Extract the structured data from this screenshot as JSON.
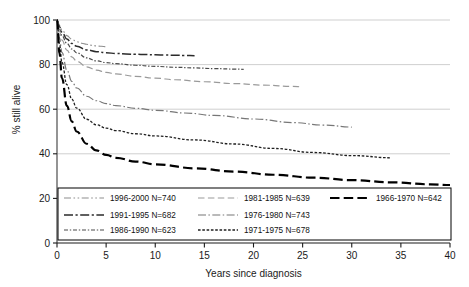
{
  "chart_data": {
    "type": "line",
    "title": "",
    "xlabel": "Years since diagnosis",
    "ylabel": "% still alive",
    "xlim": [
      0,
      40
    ],
    "ylim": [
      0,
      100
    ],
    "xticks": [
      0,
      5,
      10,
      15,
      20,
      25,
      30,
      35,
      40
    ],
    "yticks": [
      0,
      20,
      40,
      60,
      80,
      100
    ],
    "xtick_labels": [
      "0",
      "5",
      "10",
      "15",
      "20",
      "25",
      "30",
      "35",
      "40"
    ],
    "ytick_labels": [
      "0",
      "20",
      "40",
      "60",
      "80",
      "100"
    ],
    "grid": "horizontal",
    "legend_position": "bottom-inside",
    "series": [
      {
        "name": "1996-2000",
        "n": 740,
        "label": "1996-2000 N=740",
        "dash": "dash-dot-dot",
        "color": "#8d8d8d",
        "x": [
          0,
          0.25,
          0.5,
          1,
          1.5,
          2,
          2.5,
          3,
          3.5,
          4,
          4.5,
          5
        ],
        "y": [
          100,
          97.5,
          95.5,
          93.0,
          91.4,
          90.3,
          89.6,
          89.1,
          88.7,
          88.4,
          88.2,
          88.0
        ]
      },
      {
        "name": "1991-1995",
        "n": 682,
        "label": "1991-1995 N=682",
        "dash": "long-dash-dot",
        "color": "#2b2b2b",
        "x": [
          0,
          0.25,
          0.5,
          1,
          1.5,
          2,
          3,
          4,
          5,
          6,
          7,
          8,
          9,
          10,
          11,
          12,
          13,
          14
        ],
        "y": [
          100,
          97.0,
          94.5,
          91.5,
          89.5,
          88.2,
          86.6,
          85.8,
          85.3,
          85.0,
          84.8,
          84.6,
          84.5,
          84.4,
          84.3,
          84.2,
          84.1,
          84.0
        ]
      },
      {
        "name": "1986-1990",
        "n": 623,
        "label": "1986-1990 N=623",
        "dash": "fine-dash-dot",
        "color": "#4a4a4a",
        "x": [
          0,
          0.25,
          0.5,
          1,
          1.5,
          2,
          3,
          4,
          5,
          6,
          8,
          10,
          12,
          14,
          16,
          18,
          19
        ],
        "y": [
          100,
          96.0,
          93.0,
          89.5,
          87.0,
          85.3,
          83.0,
          81.7,
          80.9,
          80.4,
          79.7,
          79.2,
          78.8,
          78.5,
          78.2,
          78.0,
          77.9
        ]
      },
      {
        "name": "1981-1985",
        "n": 639,
        "label": "1981-1985 N=639",
        "dash": "dash",
        "color": "#9a9a9a",
        "x": [
          0,
          0.25,
          0.5,
          1,
          1.5,
          2,
          3,
          4,
          5,
          6,
          8,
          10,
          12,
          15,
          18,
          21,
          24,
          25
        ],
        "y": [
          100,
          95.0,
          91.0,
          86.5,
          83.5,
          81.5,
          79.0,
          77.5,
          76.5,
          75.8,
          74.7,
          73.9,
          73.2,
          72.3,
          71.5,
          70.8,
          70.2,
          70.0
        ]
      },
      {
        "name": "1976-1980",
        "n": 743,
        "label": "1976-1980 N=743",
        "dash": "dash-dot-short",
        "color": "#777777",
        "x": [
          0,
          0.25,
          0.5,
          1,
          1.5,
          2,
          3,
          4,
          5,
          6,
          8,
          10,
          13,
          16,
          20,
          24,
          27,
          30
        ],
        "y": [
          100,
          92.0,
          85.5,
          77.5,
          72.5,
          69.5,
          65.8,
          63.8,
          62.5,
          61.6,
          60.4,
          59.5,
          58.3,
          57.2,
          55.6,
          54.0,
          52.9,
          52.0
        ]
      },
      {
        "name": "1971-1975",
        "n": 678,
        "label": "1971-1975 N=678",
        "dash": "dot-dense",
        "color": "#1f1f1f",
        "x": [
          0,
          0.25,
          0.5,
          1,
          1.5,
          2,
          3,
          4,
          5,
          6,
          8,
          10,
          14,
          18,
          22,
          26,
          30,
          34
        ],
        "y": [
          100,
          89.0,
          81.0,
          71.0,
          64.5,
          60.5,
          55.5,
          53.0,
          51.5,
          50.4,
          49.0,
          48.0,
          46.2,
          44.4,
          42.4,
          40.6,
          39.2,
          38.2
        ]
      },
      {
        "name": "1966-1970",
        "n": 642,
        "label": "1966-1970 N=642",
        "dash": "thick-long-dash",
        "color": "#000000",
        "x": [
          0,
          0.25,
          0.5,
          1,
          1.5,
          2,
          3,
          4,
          5,
          6,
          8,
          10,
          14,
          18,
          22,
          26,
          30,
          34,
          38,
          40
        ],
        "y": [
          100,
          85.0,
          74.0,
          61.5,
          54.5,
          50.0,
          44.5,
          41.5,
          39.5,
          38.2,
          36.5,
          35.3,
          33.5,
          32.0,
          30.6,
          29.3,
          28.2,
          27.2,
          26.3,
          26.0
        ]
      }
    ],
    "legend_layout": [
      [
        "1996-2000",
        "1981-1985",
        "1966-1970"
      ],
      [
        "1991-1995",
        "1976-1980"
      ],
      [
        "1986-1990",
        "1971-1975"
      ]
    ]
  }
}
